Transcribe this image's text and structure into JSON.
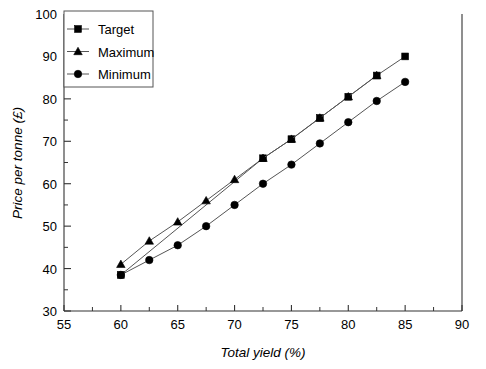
{
  "chart_data": {
    "type": "line",
    "title": "",
    "xlabel": "Total yield (%)",
    "ylabel": "Price per tonne (£)",
    "xlim": [
      55,
      90
    ],
    "ylim": [
      30,
      100
    ],
    "xticks": [
      55,
      60,
      65,
      70,
      75,
      80,
      85,
      90
    ],
    "yticks": [
      30,
      40,
      50,
      60,
      70,
      80,
      90,
      100
    ],
    "xtick_minor_step": 2.5,
    "ytick_minor_step": 5,
    "grid": false,
    "legend_position": "top-left",
    "series": [
      {
        "name": "Target",
        "marker": "square",
        "x": [
          60,
          72.5,
          75,
          77.5,
          80,
          82.5,
          85
        ],
        "y": [
          38.5,
          66,
          70.5,
          75.5,
          80.5,
          85.5,
          90
        ]
      },
      {
        "name": "Maximum",
        "marker": "triangle",
        "x": [
          60,
          62.5,
          65,
          67.5,
          70,
          72.5,
          75,
          77.5,
          80,
          82.5
        ],
        "y": [
          41,
          46.5,
          51,
          56,
          61,
          66,
          70.5,
          75.5,
          80.5,
          85.5
        ]
      },
      {
        "name": "Minimum",
        "marker": "circle",
        "x": [
          60,
          62.5,
          65,
          67.5,
          70,
          72.5,
          75,
          77.5,
          80,
          82.5,
          85
        ],
        "y": [
          38.5,
          42,
          45.5,
          50,
          55,
          60,
          64.5,
          69.5,
          74.5,
          79.5,
          84
        ]
      }
    ]
  },
  "legend": {
    "items": [
      {
        "label": "Target"
      },
      {
        "label": "Maximum"
      },
      {
        "label": "Minimum"
      }
    ]
  },
  "axes": {
    "x_title": "Total yield (%)",
    "y_title": "Price per tonne (£)",
    "x_labels": [
      "55",
      "60",
      "65",
      "70",
      "75",
      "80",
      "85",
      "90"
    ],
    "y_labels": [
      "30",
      "40",
      "50",
      "60",
      "70",
      "80",
      "90",
      "100"
    ]
  },
  "colors": {
    "ink": "#000000",
    "axis": "#333333",
    "line": "#555555",
    "background": "#ffffff"
  }
}
